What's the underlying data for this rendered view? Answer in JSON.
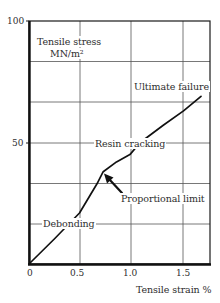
{
  "chart_data": {
    "type": "line",
    "title": "",
    "xlabel": "Tensile strain %",
    "ylabel": "Tensile stress MN/m²",
    "ylabel_line1": "Tensile stress",
    "ylabel_line2": "MN/m²",
    "xlim": [
      0,
      1.76
    ],
    "ylim": [
      0,
      100
    ],
    "x_ticks": [
      {
        "value": 0,
        "label": "0"
      },
      {
        "value": 0.5,
        "label": "0.5"
      },
      {
        "value": 1.0,
        "label": "1.0"
      },
      {
        "value": 1.5,
        "label": "1.5"
      }
    ],
    "y_ticks": [
      {
        "value": 50,
        "label": "50"
      },
      {
        "value": 100,
        "label": "100"
      }
    ],
    "grid": true,
    "x_gridlines": [
      0.5,
      1.0,
      1.5
    ],
    "y_gridlines": [
      16.7,
      33.3,
      50,
      66.7,
      83.3
    ],
    "legend": null,
    "series": [
      {
        "name": "Tensile stress-strain",
        "x": [
          0,
          0.25,
          0.49,
          0.66,
          0.72,
          0.85,
          0.98,
          1.08,
          1.3,
          1.5,
          1.67
        ],
        "y": [
          0,
          10.5,
          21,
          33,
          38,
          42,
          45,
          50,
          57,
          63,
          69
        ]
      }
    ],
    "annotations": [
      {
        "text": "Debonding",
        "x": 0.48,
        "y": 16.7
      },
      {
        "text": "Proportional limit",
        "x": 0.72,
        "y": 38,
        "arrow": true
      },
      {
        "text": "Resin cracking",
        "x": 0.9,
        "y": 49
      },
      {
        "text": "Ultimate failure",
        "x": 1.67,
        "y": 69
      }
    ]
  },
  "labels": {
    "ultimate_failure": "Ultimate failure",
    "resin_cracking": "Resin cracking",
    "proportional_limit": "Proportional limit",
    "debonding": "Debonding"
  },
  "colors": {
    "axis": "#1a1a1a",
    "grid": "#555555",
    "curve": "#111111",
    "text": "#2e2e2e"
  }
}
